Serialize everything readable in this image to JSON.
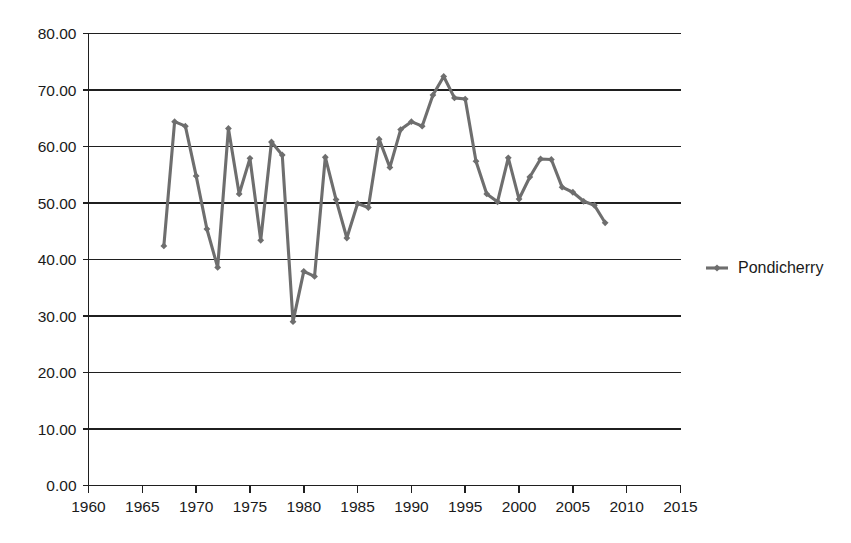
{
  "chart_data": {
    "type": "line",
    "title": "",
    "subtitle": "",
    "xlabel": "",
    "ylabel": "",
    "grid": "horizontal",
    "legend_position": "right",
    "xlim": [
      1960,
      2015
    ],
    "ylim": [
      0,
      80
    ],
    "x_tick_step": 5,
    "y_tick_step": 10,
    "x_tick_labels": [
      "1960",
      "1965",
      "1970",
      "1975",
      "1980",
      "1985",
      "1990",
      "1995",
      "2000",
      "2005",
      "2010",
      "2015"
    ],
    "y_tick_labels": [
      "0.00",
      "10.00",
      "20.00",
      "30.00",
      "40.00",
      "50.00",
      "60.00",
      "70.00",
      "80.00"
    ],
    "x_ticks": [
      1960,
      1965,
      1970,
      1975,
      1980,
      1985,
      1990,
      1995,
      2000,
      2005,
      2010,
      2015
    ],
    "y_ticks": [
      0,
      10,
      20,
      30,
      40,
      50,
      60,
      70,
      80
    ],
    "series": [
      {
        "name": "Pondicherry",
        "color": "#6e6e6e",
        "marker": "diamond",
        "x": [
          1967,
          1968,
          1969,
          1970,
          1971,
          1972,
          1973,
          1974,
          1975,
          1976,
          1977,
          1978,
          1979,
          1980,
          1981,
          1982,
          1983,
          1984,
          1985,
          1986,
          1987,
          1988,
          1989,
          1990,
          1991,
          1992,
          1993,
          1994,
          1995,
          1996,
          1997,
          1998,
          1999,
          2000,
          2001,
          2002,
          2003,
          2004,
          2005,
          2006,
          2007,
          2008
        ],
        "values": [
          42.4,
          64.4,
          63.6,
          54.8,
          45.4,
          38.6,
          63.2,
          51.6,
          57.9,
          43.4,
          60.8,
          58.5,
          29.0,
          37.9,
          37.0,
          58.1,
          50.6,
          43.8,
          49.9,
          49.2,
          61.3,
          56.3,
          63.0,
          64.4,
          63.6,
          69.1,
          72.4,
          68.6,
          68.4,
          57.4,
          51.6,
          50.2,
          58.0,
          50.7,
          54.6,
          57.8,
          57.7,
          52.8,
          51.9,
          50.3,
          49.6,
          46.5
        ]
      }
    ],
    "legend": [
      {
        "label": "Pondicherry",
        "color": "#6e6e6e",
        "marker": "diamond"
      }
    ]
  },
  "legend": {
    "entries": [
      {
        "label": "Pondicherry"
      }
    ]
  },
  "axes": {
    "y_axis_name": "value-axis",
    "x_axis_name": "year-axis"
  }
}
